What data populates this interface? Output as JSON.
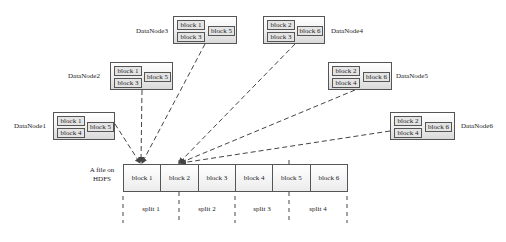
{
  "diagram": {
    "file_label_line1": "A file on",
    "file_label_line2": "HDFS",
    "file_blocks": [
      "block 1",
      "block 2",
      "block 3",
      "block 4",
      "block 5",
      "block 6"
    ],
    "splits": [
      "split 1",
      "split 2",
      "split 3",
      "split 4"
    ],
    "datanodes": [
      {
        "name": "DataNode1",
        "blocks": [
          "block 1",
          "block 4",
          "block 5"
        ]
      },
      {
        "name": "DataNode2",
        "blocks": [
          "block 1",
          "block 3",
          "block 5"
        ]
      },
      {
        "name": "DataNode3",
        "blocks": [
          "block 1",
          "block 3",
          "block 5"
        ]
      },
      {
        "name": "DataNode4",
        "blocks": [
          "block 2",
          "block 3",
          "block 6"
        ]
      },
      {
        "name": "DataNode5",
        "blocks": [
          "block 2",
          "block 4",
          "block 6"
        ]
      },
      {
        "name": "DataNode6",
        "blocks": [
          "block 2",
          "block 4",
          "block 6"
        ]
      }
    ],
    "colors": {
      "line": "#444444",
      "border": "#555555",
      "block_fill": "#e4e4e4"
    }
  }
}
